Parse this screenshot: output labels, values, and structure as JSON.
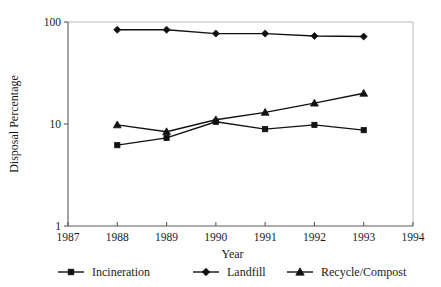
{
  "chart_data": {
    "type": "line",
    "title": "",
    "xlabel": "Year",
    "ylabel": "Disposal Percentage",
    "yscale": "log",
    "ylim": [
      1,
      100
    ],
    "xlim": [
      1987,
      1994
    ],
    "grid": false,
    "legend_position": "bottom",
    "x": [
      1988,
      1989,
      1990,
      1991,
      1992,
      1993
    ],
    "xticks": [
      "1987",
      "1988",
      "1989",
      "1990",
      "1991",
      "1992",
      "1993",
      "1994"
    ],
    "xtick_values": [
      1987,
      1988,
      1989,
      1990,
      1991,
      1992,
      1993,
      1994
    ],
    "yticks": [
      "100",
      "10",
      "1"
    ],
    "ytick_values": [
      100,
      10,
      1
    ],
    "series": [
      {
        "name": "Incineration",
        "marker": "square",
        "values": [
          6.2,
          7.3,
          10.5,
          8.9,
          9.8,
          8.7
        ]
      },
      {
        "name": "Landfill",
        "marker": "diamond",
        "values": [
          84,
          84,
          77,
          77,
          73,
          72
        ]
      },
      {
        "name": "Recycle/Compost",
        "marker": "triangle",
        "values": [
          9.8,
          8.4,
          11.0,
          13.0,
          16.0,
          20.0
        ]
      }
    ],
    "colors": {
      "series": "#111111",
      "axis": "#5a5a5a",
      "frame": "#b9b9b9",
      "text": "#1a1a1a",
      "background": "#ffffff"
    }
  }
}
